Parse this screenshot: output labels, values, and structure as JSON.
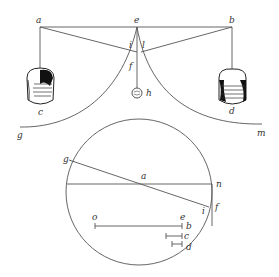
{
  "figure": {
    "type": "geometric-physics-diagram",
    "upper_apparatus": {
      "labels": {
        "a": "a",
        "e": "e",
        "b": "b",
        "i": "i",
        "l": "l",
        "f": "f",
        "h": "h",
        "c": "c",
        "d": "d",
        "g": "g",
        "m": "m"
      },
      "weights": [
        "c",
        "d"
      ],
      "plumb_bob": "h"
    },
    "lower_circle": {
      "labels": {
        "g": "g",
        "a": "a",
        "n": "n",
        "i": "i",
        "f": "f",
        "o": "o",
        "e": "e",
        "b": "b",
        "c": "c",
        "d": "d"
      }
    },
    "colors": {
      "line": "#555555",
      "text": "#333333",
      "background": "#ffffff"
    }
  }
}
